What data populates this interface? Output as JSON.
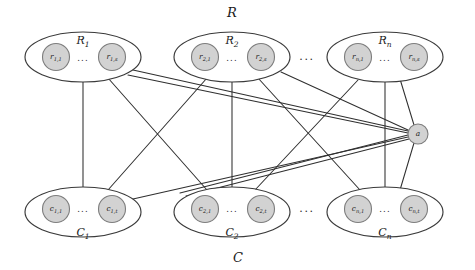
{
  "diagram": {
    "title": "R",
    "bottom_title": "C",
    "width": 475,
    "height": 270,
    "colors": {
      "node_fill": "#d2d2d2",
      "node_stroke": "#7d7d7d",
      "ellipse_stroke": "#3a3a3a",
      "edge_stroke": "#2f2f2f",
      "background": "#ffffff",
      "text": "#1a1a1a"
    },
    "row_groups": [
      {
        "label": "R",
        "label_sub": "1",
        "cx": 83,
        "cy": 57,
        "rx": 58,
        "ry": 25,
        "label_x": 83,
        "label_y": 44,
        "dots": "...",
        "dots_x": 83,
        "dots_y": 58,
        "nodes": [
          {
            "name": "r",
            "sub": "1,1",
            "cx": 56,
            "cy": 57,
            "r": 13.5
          },
          {
            "name": "r",
            "sub": "1,s",
            "cx": 112,
            "cy": 57,
            "r": 13.5
          }
        ]
      },
      {
        "label": "R",
        "label_sub": "2",
        "cx": 232,
        "cy": 57,
        "rx": 58,
        "ry": 25,
        "label_x": 232,
        "label_y": 44,
        "dots": "...",
        "dots_x": 232,
        "dots_y": 58,
        "nodes": [
          {
            "name": "r",
            "sub": "2,1",
            "cx": 205,
            "cy": 57,
            "r": 13.5
          },
          {
            "name": "r",
            "sub": "2,s",
            "cx": 261,
            "cy": 57,
            "r": 13.5
          }
        ]
      },
      {
        "label": "R",
        "label_sub": "n",
        "cx": 385,
        "cy": 57,
        "rx": 58,
        "ry": 25,
        "label_x": 385,
        "label_y": 44,
        "dots": "...",
        "dots_x": 385,
        "dots_y": 58,
        "nodes": [
          {
            "name": "r",
            "sub": "n,1",
            "cx": 358,
            "cy": 57,
            "r": 13.5
          },
          {
            "name": "r",
            "sub": "n,s",
            "cx": 414,
            "cy": 57,
            "r": 13.5
          }
        ]
      }
    ],
    "col_groups": [
      {
        "label": "C",
        "label_sub": "1",
        "cx": 83,
        "cy": 212,
        "rx": 58,
        "ry": 25,
        "label_x": 83,
        "label_y": 236,
        "dots": "...",
        "dots_x": 83,
        "dots_y": 209,
        "nodes": [
          {
            "name": "c",
            "sub": "1,1",
            "cx": 56,
            "cy": 209,
            "r": 13.5
          },
          {
            "name": "c",
            "sub": "1,t",
            "cx": 112,
            "cy": 209,
            "r": 13.5
          }
        ]
      },
      {
        "label": "C",
        "label_sub": "2",
        "cx": 232,
        "cy": 212,
        "rx": 58,
        "ry": 25,
        "label_x": 232,
        "label_y": 236,
        "dots": "...",
        "dots_x": 232,
        "dots_y": 209,
        "nodes": [
          {
            "name": "c",
            "sub": "2,1",
            "cx": 205,
            "cy": 209,
            "r": 13.5
          },
          {
            "name": "c",
            "sub": "2,t",
            "cx": 261,
            "cy": 209,
            "r": 13.5
          }
        ]
      },
      {
        "label": "C",
        "label_sub": "n",
        "cx": 385,
        "cy": 212,
        "rx": 58,
        "ry": 25,
        "label_x": 385,
        "label_y": 236,
        "dots": "...",
        "dots_x": 385,
        "dots_y": 209,
        "nodes": [
          {
            "name": "c",
            "sub": "n,1",
            "cx": 358,
            "cy": 209,
            "r": 13.5
          },
          {
            "name": "c",
            "sub": "n,t",
            "cx": 414,
            "cy": 209,
            "r": 13.5
          }
        ]
      }
    ],
    "apex_node": {
      "label": "a",
      "cx": 418,
      "cy": 134,
      "r": 10
    },
    "ellipsis_markers": [
      {
        "name": "row-ellipsis",
        "text": "...",
        "x": 307,
        "y": 57
      },
      {
        "name": "col-ellipsis",
        "text": "...",
        "x": 307,
        "y": 209
      }
    ],
    "set_labels": [
      {
        "name": "set-label-R",
        "text": "R",
        "x": 232,
        "y": 17
      },
      {
        "name": "set-label-C",
        "text": "C",
        "x": 238,
        "y": 262
      }
    ],
    "edges": [
      {
        "from": "R1",
        "to": "C1",
        "x1": 83,
        "y1": 82,
        "x2": 83,
        "y2": 187
      },
      {
        "from": "R1",
        "to": "C2",
        "x1": 108,
        "y1": 78,
        "x2": 207,
        "y2": 190
      },
      {
        "from": "R2",
        "to": "C1",
        "x1": 207,
        "y1": 78,
        "x2": 108,
        "y2": 190
      },
      {
        "from": "R1",
        "to": "a",
        "x1": 133,
        "y1": 70,
        "x2": 408,
        "y2": 131
      },
      {
        "from": "R2",
        "to": "C2",
        "x1": 232,
        "y1": 82,
        "x2": 232,
        "y2": 187
      },
      {
        "from": "R2",
        "to": "Cn",
        "x1": 258,
        "y1": 78,
        "x2": 360,
        "y2": 190
      },
      {
        "from": "Rn",
        "to": "C2",
        "x1": 358,
        "y1": 80,
        "x2": 255,
        "y2": 190
      },
      {
        "from": "Rn",
        "to": "Cn",
        "x1": 385,
        "y1": 82,
        "x2": 385,
        "y2": 187
      },
      {
        "from": "Rn",
        "to": "a",
        "x1": 400,
        "y1": 79,
        "x2": 414,
        "y2": 125
      },
      {
        "from": "a",
        "to": "Cn",
        "x1": 414,
        "y1": 143,
        "x2": 400,
        "y2": 190
      },
      {
        "from": "a",
        "to": "C1",
        "x1": 408,
        "y1": 137,
        "x2": 133,
        "y2": 199
      },
      {
        "from": "a",
        "to": "C2",
        "x1": 409,
        "y1": 139,
        "x2": 186,
        "y2": 196
      },
      {
        "from": "R2",
        "to": "a",
        "x1": 281,
        "y1": 72,
        "x2": 408,
        "y2": 130
      },
      {
        "from": "a",
        "to": "C2b",
        "x1": 408,
        "y1": 135,
        "x2": 180,
        "y2": 193
      },
      {
        "from": "R1b",
        "to": "a",
        "x1": 128,
        "y1": 75,
        "x2": 408,
        "y2": 133
      }
    ]
  }
}
